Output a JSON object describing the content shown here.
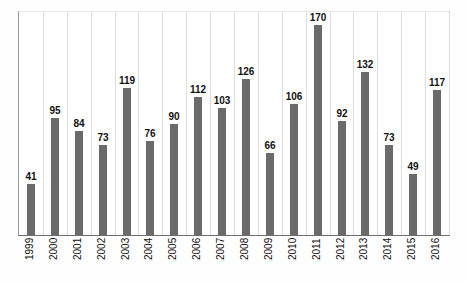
{
  "chart_data": {
    "type": "bar",
    "title": "",
    "subtitle": "",
    "xlabel": "",
    "ylabel": "",
    "categories": [
      "1999",
      "2000",
      "2001",
      "2002",
      "2003",
      "2004",
      "2005",
      "2006",
      "2007",
      "2008",
      "2009",
      "2010",
      "2011",
      "2012",
      "2013",
      "2014",
      "2015",
      "2016"
    ],
    "values": [
      41,
      95,
      84,
      73,
      119,
      76,
      90,
      112,
      103,
      126,
      66,
      106,
      170,
      92,
      132,
      73,
      49,
      117
    ],
    "series": [
      {
        "name": "",
        "values": [
          41,
          95,
          84,
          73,
          119,
          76,
          90,
          112,
          103,
          126,
          66,
          106,
          170,
          92,
          132,
          73,
          49,
          117
        ]
      }
    ],
    "data_labels": [
      "41",
      "95",
      "84",
      "73",
      "119",
      "76",
      "90",
      "112",
      "103",
      "126",
      "66",
      "106",
      "170",
      "92",
      "132",
      "73",
      "49",
      "117"
    ],
    "ylim": [
      0,
      180
    ],
    "xlim_categories": 18,
    "grid": {
      "vertical": true,
      "horizontal": false
    },
    "legend": {
      "visible": false,
      "position": "none"
    },
    "axis": {
      "y_tick_labels_visible": false,
      "x_tick_labels_rotation_deg": 90
    },
    "colors": {
      "bar": "#6a6a6a",
      "gridline": "#dcdcdc",
      "axis": "#6e6e6e",
      "plot_background": "#ffffff",
      "page_background": "#fefefe",
      "label_text": "#111111"
    }
  }
}
